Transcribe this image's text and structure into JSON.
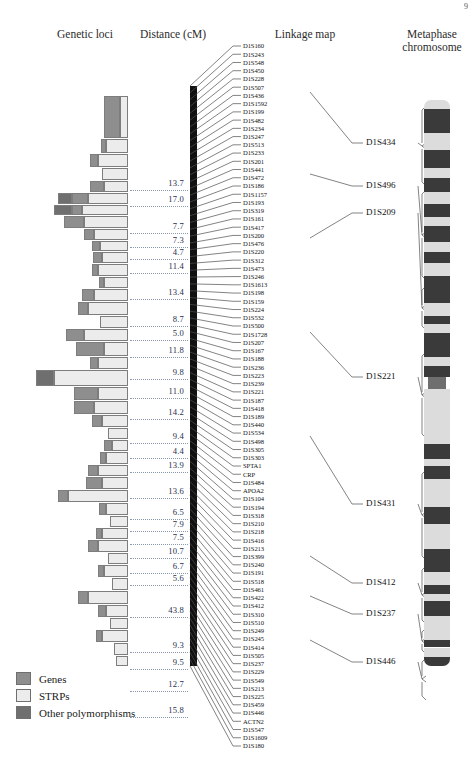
{
  "page_number": "9",
  "headers": {
    "genetic_loci": "Genetic loci",
    "distance": "Distance (cM)",
    "linkage_map": "Linkage map",
    "metaphase": "Metaphase\nchromosome",
    "metaphase_line1": "Metaphase",
    "metaphase_line2": "chromosome"
  },
  "legend": {
    "items": [
      {
        "label": "Genes",
        "color": "#8e8e8e",
        "key": "gene"
      },
      {
        "label": "STRPs",
        "color": "#ececec",
        "key": "strp"
      },
      {
        "label": "Other polymorphisms",
        "color": "#6f6f6f",
        "key": "other"
      }
    ]
  },
  "distances": {
    "unit": "cM",
    "values": [
      "13.7",
      "17.0",
      "7.7",
      "7.3",
      "4.7",
      "11.4",
      "13.4",
      "8.7",
      "5.0",
      "11.8",
      "9.8",
      "11.0",
      "14.2",
      "9.4",
      "4.4",
      "13.9",
      "13.6",
      "6.5",
      "7.9",
      "7.5",
      "10.7",
      "6.7",
      "5.6",
      "43.8",
      "9.3",
      "9.5",
      "12.7",
      "15.8"
    ]
  },
  "bracket_labels": [
    "D1S434",
    "D1S496",
    "D1S209",
    "D1S221",
    "D1S431",
    "D1S412",
    "D1S237",
    "D1S446"
  ],
  "chart_data": {
    "type": "table",
    "xlabel": "Genetic loci",
    "ylabel": "Distance (cM)",
    "legend_position": "bottom-left",
    "marker_count": 99,
    "markers": [
      "D1S160",
      "D1S243",
      "D1S548",
      "D1S450",
      "D1S228",
      "D1S507",
      "D1S436",
      "D1S1592",
      "D1S199",
      "D1S482",
      "D1S234",
      "D1S247",
      "D1S513",
      "D1S233",
      "D1S201",
      "D1S441",
      "D1S472",
      "D1S186",
      "D1S1157",
      "D1S193",
      "D1S319",
      "D1S161",
      "D1S417",
      "D1S200",
      "D1S476",
      "D1S220",
      "D1S312",
      "D1S473",
      "D1S246",
      "D1S1613",
      "D1S198",
      "D1S159",
      "D1S224",
      "D1S532",
      "D1S500",
      "D1S1728",
      "D1S207",
      "D1S167",
      "D1S188",
      "D1S236",
      "D1S223",
      "D1S239",
      "D1S221",
      "D1S187",
      "D1S418",
      "D1S189",
      "D1S440",
      "D1S534",
      "D1S498",
      "D1S305",
      "D1S303",
      "SPTA1",
      "CRP",
      "D1S484",
      "APOA2",
      "D1S104",
      "D1S194",
      "D1S318",
      "D1S210",
      "D1S218",
      "D1S416",
      "D1S213",
      "D1S399",
      "D1S240",
      "D1S191",
      "D1S518",
      "D1S461",
      "D1S422",
      "D1S412",
      "D1S310",
      "D1S510",
      "D1S249",
      "D1S245",
      "D1S414",
      "D1S505",
      "D1S237",
      "D1S229",
      "D1S549",
      "D1S213",
      "D1S225",
      "D1S459",
      "D1S446",
      "ACTN2",
      "D1S547",
      "D1S1609",
      "D1S180"
    ],
    "distance_values": [
      13.7,
      17.0,
      7.7,
      7.3,
      4.7,
      11.4,
      13.4,
      8.7,
      5.0,
      11.8,
      9.8,
      11.0,
      14.2,
      9.4,
      4.4,
      13.9,
      13.6,
      6.5,
      7.9,
      7.5,
      10.7,
      6.7,
      5.6,
      43.8,
      9.3,
      9.5,
      12.7,
      15.8
    ],
    "categories": [
      "Genes",
      "STRPs",
      "Other polymorphisms"
    ]
  }
}
